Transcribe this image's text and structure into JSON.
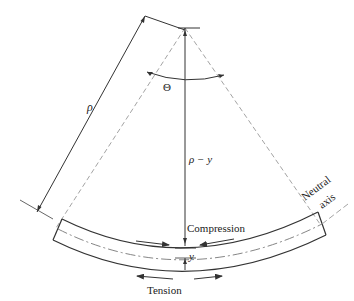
{
  "figure": {
    "type": "beam-bending-geometry",
    "labels": {
      "rho": "ρ",
      "theta": "Θ",
      "rho_minus_y": "ρ − y",
      "compression": "Compression",
      "tension": "Tension",
      "y": "y",
      "neutral_axis_line1": "Neutral",
      "neutral_axis_line2": "axis"
    },
    "colors": {
      "stroke": "#333333",
      "dashed": "#888888",
      "text": "#222222",
      "background": "#ffffff"
    }
  }
}
